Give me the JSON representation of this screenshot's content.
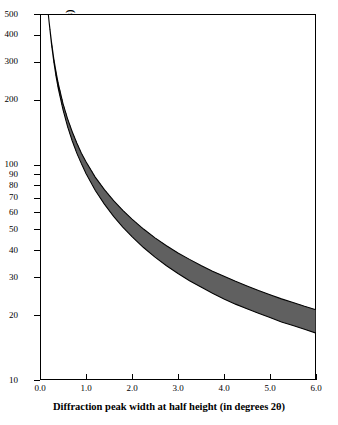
{
  "chart_data": {
    "type": "line",
    "title": "",
    "xlabel": "Diffraction peak width at half height (in degrees 2θ)",
    "ylabel": "Average size of crystals perpendicular to the diffracting plane (in angstroms)",
    "xlim": [
      0.0,
      6.0
    ],
    "ylim": [
      10,
      500
    ],
    "yscale": "log",
    "grid": false,
    "legend": null,
    "xticks": [
      "0.0",
      "1.0",
      "2.0",
      "3.0",
      "4.0",
      "5.0",
      "6.0"
    ],
    "xtick_values": [
      0.0,
      1.0,
      2.0,
      3.0,
      4.0,
      5.0,
      6.0
    ],
    "yticks": [
      "10",
      "20",
      "30",
      "40",
      "50",
      "60",
      "70",
      "80",
      "90",
      "100",
      "200",
      "300",
      "400",
      "500"
    ],
    "ytick_values": [
      10,
      20,
      30,
      40,
      50,
      60,
      70,
      80,
      90,
      100,
      200,
      300,
      400,
      500
    ],
    "series": [
      {
        "name": "Scherrer band",
        "style": "filled-band",
        "x": [
          0.18,
          0.2,
          0.25,
          0.3,
          0.35,
          0.4,
          0.5,
          0.6,
          0.7,
          0.8,
          0.9,
          1.0,
          1.2,
          1.4,
          1.6,
          1.8,
          2.0,
          2.25,
          2.5,
          2.75,
          3.0,
          3.25,
          3.5,
          3.75,
          4.0,
          4.25,
          4.5,
          4.75,
          5.0,
          5.25,
          5.5,
          5.75,
          6.0
        ],
        "y_upper": [
          500,
          455,
          370,
          310,
          268,
          236,
          192,
          163,
          142,
          126,
          113,
          103,
          87.5,
          76.5,
          68.0,
          61.3,
          55.8,
          50.2,
          45.7,
          42.0,
          38.9,
          36.3,
          34.0,
          32.0,
          30.3,
          28.7,
          27.3,
          26.0,
          24.9,
          23.8,
          22.9,
          22.0,
          21.2
        ],
        "y_lower": [
          500,
          455,
          362,
          300,
          256,
          224,
          180,
          150,
          129,
          113,
          101,
          91.0,
          76.0,
          65.5,
          57.5,
          51.3,
          46.3,
          41.2,
          37.2,
          33.9,
          31.2,
          28.9,
          27.0,
          25.3,
          23.8,
          22.5,
          21.4,
          20.4,
          19.5,
          18.6,
          17.9,
          17.2,
          16.5
        ]
      }
    ]
  }
}
